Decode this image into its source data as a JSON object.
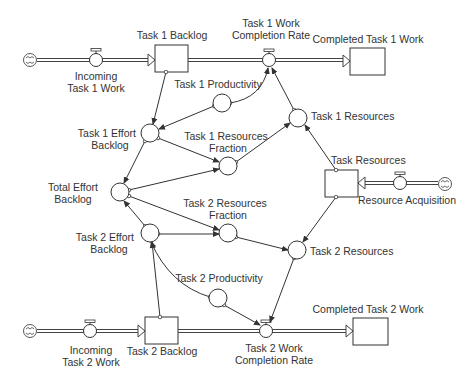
{
  "diagram": {
    "type": "stock-and-flow",
    "colors": {
      "line": "#333333",
      "text": "#333333",
      "background": "#ffffff"
    },
    "stocks": {
      "task1_backlog": "Task 1 Backlog",
      "completed_task1": "Completed Task 1 Work",
      "task_resources": "Task Resources",
      "task2_backlog": "Task 2 Backlog",
      "completed_task2": "Completed Task 2 Work"
    },
    "flows": {
      "incoming_task1": {
        "line1": "Incoming",
        "line2": "Task 1 Work"
      },
      "task1_completion": {
        "line1": "Task 1 Work",
        "line2": "Completion Rate"
      },
      "resource_acquisition": "Resource Acquisition",
      "incoming_task2": {
        "line1": "Incoming",
        "line2": "Task 2 Work"
      },
      "task2_completion": {
        "line1": "Task 2 Work",
        "line2": "Completion Rate"
      }
    },
    "auxiliaries": {
      "task1_productivity": "Task 1 Productivity",
      "task1_effort_backlog": {
        "line1": "Task 1 Effort",
        "line2": "Backlog"
      },
      "task1_resources_fraction": {
        "line1": "Task 1 Resources",
        "line2": "Fraction"
      },
      "task1_resources": "Task 1 Resources",
      "total_effort_backlog": {
        "line1": "Total Effort",
        "line2": "Backlog"
      },
      "task2_resources_fraction": {
        "line1": "Task 2 Resources",
        "line2": "Fraction"
      },
      "task2_effort_backlog": {
        "line1": "Task 2 Effort",
        "line2": "Backlog"
      },
      "task2_resources": "Task 2 Resources",
      "task2_productivity": "Task 2 Productivity"
    },
    "sources": {
      "cloud_task1": "cloud-icon",
      "cloud_task2": "cloud-icon",
      "cloud_resources": "cloud-icon"
    }
  }
}
